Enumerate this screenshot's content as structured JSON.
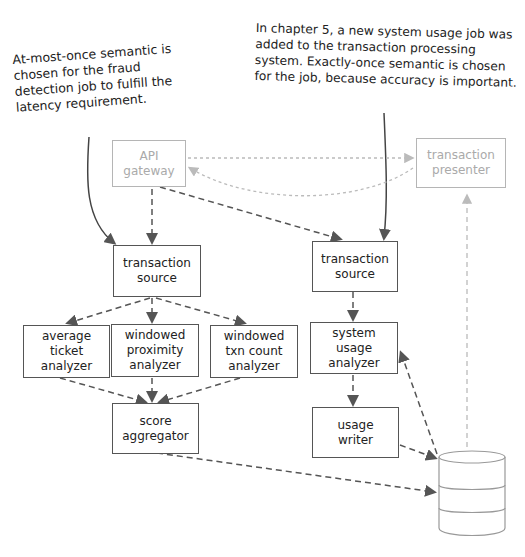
{
  "annotations": {
    "left": "At-most-once semantic is\nchosen for the fraud\ndetection job to fulfill the\nlatency requirement.",
    "right": "In chapter 5, a new system usage job was\nadded to the transaction processing\nsystem. Exactly-once semantic is chosen\nfor the job, because accuracy is important."
  },
  "nodes": {
    "api_gateway": "API\ngateway",
    "transaction_presenter": "transaction\npresenter",
    "fraud_transaction_source": "transaction\nsource",
    "usage_transaction_source": "transaction\nsource",
    "average_ticket_analyzer": "average\nticket\nanalyzer",
    "windowed_proximity_analyzer": "windowed\nproximity\nanalyzer",
    "windowed_txn_count_analyzer": "windowed\ntxn count\nanalyzer",
    "score_aggregator": "score\naggregator",
    "system_usage_analyzer": "system\nusage\nanalyzer",
    "usage_writer": "usage\nwriter",
    "database": ""
  },
  "colors": {
    "line": "#555555",
    "faded": "#b5b5b5"
  }
}
